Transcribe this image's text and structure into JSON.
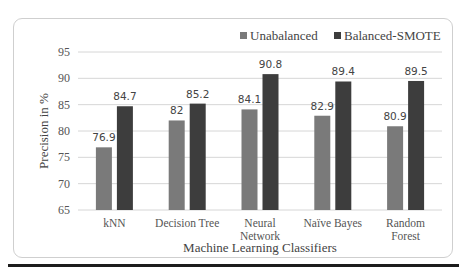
{
  "chart_data": {
    "type": "bar",
    "title": "",
    "xlabel": "Machine Learning Classifiers",
    "ylabel": "Precision in %",
    "ylim": [
      65,
      95
    ],
    "yticks": [
      65,
      70,
      75,
      80,
      85,
      90,
      95
    ],
    "grid": true,
    "legend_position": "top-right",
    "categories": [
      "kNN",
      "Decision Tree",
      "Neural Network",
      "Naïve Bayes",
      "Random Forest"
    ],
    "category_lines": [
      [
        "kNN"
      ],
      [
        "Decision Tree"
      ],
      [
        "Neural",
        "Network"
      ],
      [
        "Naïve Bayes"
      ],
      [
        "Random",
        "Forest"
      ]
    ],
    "series": [
      {
        "name": "Unabalanced",
        "color": "#7a7a7a",
        "values": [
          76.9,
          82,
          84.1,
          82.9,
          80.9
        ],
        "labels": [
          "76.9",
          "82",
          "84.1",
          "82.9",
          "80.9"
        ]
      },
      {
        "name": "Balanced-SMOTE",
        "color": "#3d3d3d",
        "values": [
          84.7,
          85.2,
          90.8,
          89.4,
          89.5
        ],
        "labels": [
          "84.7",
          "85.2",
          "90.8",
          "89.4",
          "89.5"
        ]
      }
    ]
  }
}
